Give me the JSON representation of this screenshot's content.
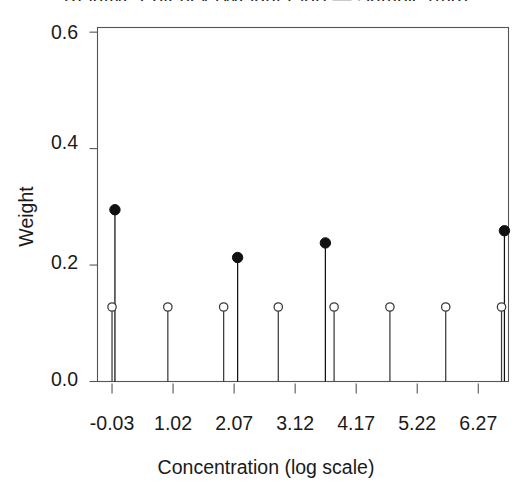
{
  "chart_data": {
    "type": "scatter",
    "title": "Relative Potency (Weight Plot) — Sample (mg)",
    "title_clipped": true,
    "xlabel": "Concentration (log scale)",
    "ylabel": "Weight",
    "xticks": [
      "-0.03",
      "1.02",
      "2.07",
      "3.12",
      "4.17",
      "5.22",
      "6.27"
    ],
    "xtick_values": [
      -0.03,
      1.02,
      2.07,
      3.12,
      4.17,
      5.22,
      6.27
    ],
    "yticks": [
      "0.0",
      "0.2",
      "0.4",
      "0.6"
    ],
    "ytick_values": [
      0.0,
      0.2,
      0.4,
      0.6
    ],
    "xlim": [
      -0.28,
      6.79
    ],
    "ylim": [
      0.0,
      0.608
    ],
    "grid": false,
    "legend": null,
    "series": [
      {
        "name": "Open circles (uniform weights)",
        "marker": "open-circle",
        "color": "#3a3a3a",
        "stem": true,
        "points": [
          {
            "x": -0.03,
            "y": 0.128
          },
          {
            "x": 0.93,
            "y": 0.128
          },
          {
            "x": 1.89,
            "y": 0.128
          },
          {
            "x": 2.83,
            "y": 0.128
          },
          {
            "x": 3.79,
            "y": 0.128
          },
          {
            "x": 4.75,
            "y": 0.128
          },
          {
            "x": 5.71,
            "y": 0.128
          },
          {
            "x": 6.67,
            "y": 0.128
          }
        ]
      },
      {
        "name": "Filled circles (fitted weights)",
        "marker": "filled-circle",
        "color": "#111111",
        "stem": true,
        "points": [
          {
            "x": 0.02,
            "y": 0.295
          },
          {
            "x": 2.13,
            "y": 0.213
          },
          {
            "x": 3.64,
            "y": 0.238
          },
          {
            "x": 6.72,
            "y": 0.259
          }
        ]
      }
    ]
  }
}
